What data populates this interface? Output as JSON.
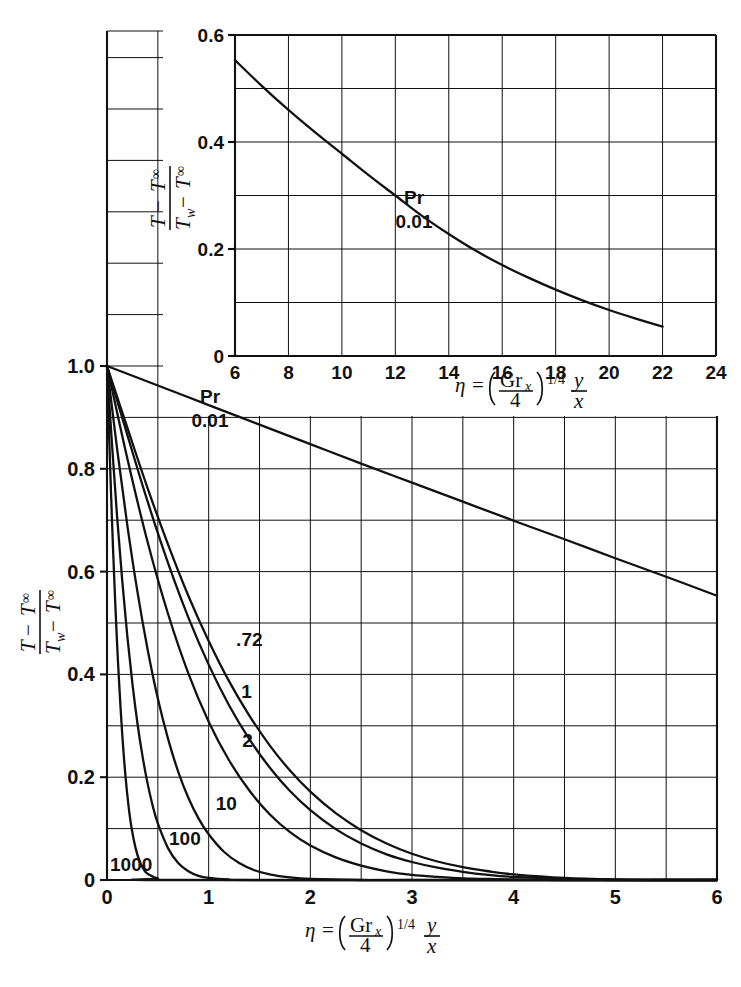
{
  "figure": {
    "kind": "line-chart-with-inset",
    "background": "#ffffff",
    "ink_color": "#111111"
  },
  "main": {
    "axis": {
      "x_ticks": [
        "0",
        "1",
        "2",
        "3",
        "4",
        "5",
        "6"
      ],
      "y_ticks": [
        "0",
        "0.2",
        "0.4",
        "0.6",
        "0.8",
        "1.0"
      ],
      "x_label_parts": {
        "eta": "η",
        "equals": "=",
        "numerator": "Gr",
        "numerator_sub": "x",
        "denominator": "4",
        "exponent": "1/4",
        "y": "y",
        "x": "x"
      },
      "y_label_parts": {
        "num_first": "T",
        "num_minus": "−",
        "num_second": "T",
        "num_second_sub": "∞",
        "den_first": "T",
        "den_first_sub": "w",
        "den_minus": "−",
        "den_second": "T",
        "den_second_sub": "∞"
      }
    },
    "annotations": {
      "pr_title": "Pr",
      "pr_value": "0.01"
    },
    "curve_labels": [
      ".72",
      "1",
      "2",
      "10",
      "100",
      "1000"
    ]
  },
  "inset": {
    "axis": {
      "x_ticks": [
        "6",
        "8",
        "10",
        "12",
        "14",
        "16",
        "18",
        "20",
        "22",
        "24"
      ],
      "y_ticks": [
        "0",
        "0.2",
        "0.4",
        "0.6"
      ],
      "x_label_parts": {
        "eta": "η",
        "equals": "=",
        "numerator": "Gr",
        "numerator_sub": "x",
        "denominator": "4",
        "exponent": "1/4",
        "y": "y",
        "x": "x"
      },
      "y_label_parts": {
        "num_first": "T",
        "num_minus": "−",
        "num_second": "T",
        "num_second_sub": "∞",
        "den_first": "T",
        "den_first_sub": "w",
        "den_minus": "−",
        "den_second": "T",
        "den_second_sub": "∞"
      }
    },
    "annotations": {
      "pr_title": "Pr",
      "pr_value": "0.01"
    }
  },
  "chart_data": [
    {
      "type": "line",
      "id": "main-panel",
      "title": "",
      "xlabel": "eta = (Gr_x/4)^(1/4) * y/x",
      "ylabel": "(T - T_inf)/(T_w - T_inf)",
      "xlim": [
        0,
        6
      ],
      "ylim": [
        0,
        1.0
      ],
      "xticks": [
        0,
        1,
        2,
        3,
        4,
        5,
        6
      ],
      "yticks": [
        0,
        0.2,
        0.4,
        0.6,
        0.8,
        1.0
      ],
      "x_minor_step": 0.5,
      "y_minor_step": 0.1,
      "grid": true,
      "legend": "inline-curve-labels",
      "annotations": [
        {
          "text": "Pr",
          "x": 1.55,
          "y": 0.955
        },
        {
          "text": "0.01",
          "x": 1.55,
          "y": 0.905
        }
      ],
      "series": [
        {
          "name": "0.01",
          "label": "Pr 0.01",
          "x": [
            0,
            0.5,
            1.0,
            1.5,
            2.0,
            2.5,
            3.0,
            3.5,
            4.0,
            4.5,
            5.0,
            5.5,
            6.0
          ],
          "y": [
            1.0,
            0.962,
            0.924,
            0.886,
            0.848,
            0.81,
            0.773,
            0.736,
            0.699,
            0.663,
            0.626,
            0.59,
            0.553
          ]
        },
        {
          "name": "0.72",
          "label": ".72",
          "x": [
            0,
            0.2,
            0.4,
            0.6,
            0.8,
            1.0,
            1.2,
            1.4,
            1.6,
            1.8,
            2.0,
            2.25,
            2.5,
            2.75,
            3.0,
            3.25,
            3.5,
            3.75,
            4.0,
            4.5,
            5.0,
            5.5,
            6.0
          ],
          "y": [
            1.0,
            0.88,
            0.762,
            0.653,
            0.553,
            0.465,
            0.387,
            0.32,
            0.262,
            0.213,
            0.172,
            0.13,
            0.097,
            0.071,
            0.051,
            0.036,
            0.025,
            0.017,
            0.011,
            0.004,
            0.001,
            0.0,
            0.0
          ]
        },
        {
          "name": "1",
          "label": "1",
          "x": [
            0,
            0.2,
            0.4,
            0.6,
            0.8,
            1.0,
            1.2,
            1.4,
            1.6,
            1.8,
            2.0,
            2.25,
            2.5,
            2.75,
            3.0,
            3.25,
            3.5,
            3.75,
            4.0,
            4.5,
            5.0,
            5.5,
            6.0
          ],
          "y": [
            1.0,
            0.866,
            0.736,
            0.617,
            0.511,
            0.419,
            0.34,
            0.274,
            0.219,
            0.173,
            0.136,
            0.099,
            0.071,
            0.05,
            0.035,
            0.024,
            0.016,
            0.01,
            0.006,
            0.002,
            0.0,
            0.0,
            0.0
          ]
        },
        {
          "name": "2",
          "label": "2",
          "x": [
            0,
            0.2,
            0.4,
            0.6,
            0.8,
            1.0,
            1.2,
            1.4,
            1.6,
            1.8,
            2.0,
            2.25,
            2.5,
            2.75,
            3.0,
            3.25,
            3.5,
            3.75,
            4.0,
            4.5,
            5.0,
            6.0
          ],
          "y": [
            1.0,
            0.82,
            0.657,
            0.518,
            0.402,
            0.308,
            0.233,
            0.174,
            0.128,
            0.093,
            0.067,
            0.044,
            0.028,
            0.017,
            0.01,
            0.006,
            0.003,
            0.002,
            0.001,
            0.0,
            0.0,
            0.0
          ]
        },
        {
          "name": "10",
          "label": "10",
          "x": [
            0,
            0.1,
            0.2,
            0.3,
            0.4,
            0.5,
            0.6,
            0.7,
            0.8,
            0.9,
            1.0,
            1.15,
            1.3,
            1.45,
            1.6,
            1.8,
            2.0,
            2.5,
            3.0,
            6.0
          ],
          "y": [
            1.0,
            0.838,
            0.69,
            0.56,
            0.448,
            0.353,
            0.275,
            0.211,
            0.16,
            0.12,
            0.089,
            0.055,
            0.033,
            0.019,
            0.011,
            0.005,
            0.002,
            0.0,
            0.0,
            0.0
          ]
        },
        {
          "name": "100",
          "label": "100",
          "x": [
            0,
            0.05,
            0.1,
            0.15,
            0.2,
            0.25,
            0.3,
            0.35,
            0.4,
            0.45,
            0.5,
            0.6,
            0.7,
            0.8,
            0.9,
            1.0,
            1.2,
            1.5,
            6.0
          ],
          "y": [
            1.0,
            0.845,
            0.705,
            0.582,
            0.474,
            0.382,
            0.304,
            0.24,
            0.187,
            0.144,
            0.11,
            0.062,
            0.033,
            0.017,
            0.008,
            0.004,
            0.001,
            0.0,
            0.0
          ]
        },
        {
          "name": "1000",
          "label": "1000",
          "x": [
            0,
            0.02,
            0.04,
            0.06,
            0.08,
            0.1,
            0.12,
            0.15,
            0.18,
            0.21,
            0.24,
            0.28,
            0.32,
            0.36,
            0.4,
            0.5,
            0.7,
            6.0
          ],
          "y": [
            1.0,
            0.87,
            0.75,
            0.641,
            0.544,
            0.457,
            0.381,
            0.283,
            0.206,
            0.147,
            0.103,
            0.063,
            0.037,
            0.021,
            0.012,
            0.003,
            0.0,
            0.0
          ]
        }
      ]
    },
    {
      "type": "line",
      "id": "inset-panel",
      "title": "",
      "xlabel": "eta = (Gr_x/4)^(1/4) * y/x",
      "ylabel": "(T - T_inf)/(T_w - T_inf)",
      "xlim": [
        6,
        24
      ],
      "ylim": [
        0,
        0.6
      ],
      "xticks": [
        6,
        8,
        10,
        12,
        14,
        16,
        18,
        20,
        22,
        24
      ],
      "yticks": [
        0,
        0.2,
        0.4,
        0.6
      ],
      "x_minor_step": 2,
      "y_minor_step": 0.1,
      "grid": true,
      "annotations": [
        {
          "text": "Pr",
          "x": 15.0,
          "y": 0.245
        },
        {
          "text": "0.01",
          "x": 15.0,
          "y": 0.195
        }
      ],
      "series": [
        {
          "name": "0.01",
          "label": "Pr 0.01",
          "x": [
            6,
            7,
            8,
            9,
            10,
            11,
            12,
            13,
            14,
            15,
            16,
            17,
            18,
            19,
            20,
            21,
            22
          ],
          "y": [
            0.553,
            0.505,
            0.46,
            0.418,
            0.378,
            0.338,
            0.3,
            0.262,
            0.228,
            0.197,
            0.17,
            0.146,
            0.124,
            0.104,
            0.086,
            0.07,
            0.055
          ]
        }
      ]
    }
  ]
}
